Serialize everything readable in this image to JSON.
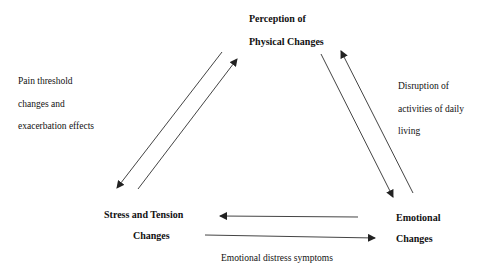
{
  "diagram": {
    "nodes": {
      "top": {
        "lines": [
          "Perception of",
          "Physical Changes"
        ]
      },
      "left": {
        "lines": [
          "Stress and Tension",
          "Changes"
        ]
      },
      "right": {
        "lines": [
          "Emotional",
          "Changes"
        ]
      }
    },
    "edge_labels": {
      "left": {
        "lines": [
          "Pain threshold",
          "changes and",
          "exacerbation effects"
        ]
      },
      "right": {
        "lines": [
          "Disruption of",
          "activities of daily",
          "living"
        ]
      },
      "bottom": {
        "lines": [
          "Emotional distress symptoms"
        ]
      }
    },
    "edges": [
      {
        "from": "Perception of Physical Changes",
        "to": "Stress and Tension Changes"
      },
      {
        "from": "Stress and Tension Changes",
        "to": "Perception of Physical Changes"
      },
      {
        "from": "Perception of Physical Changes",
        "to": "Emotional Changes"
      },
      {
        "from": "Emotional Changes",
        "to": "Perception of Physical Changes"
      },
      {
        "from": "Emotional Changes",
        "to": "Stress and Tension Changes"
      },
      {
        "from": "Stress and Tension Changes",
        "to": "Emotional Changes"
      }
    ],
    "colors": {
      "line": "#333333",
      "text": "#111111",
      "background": "#ffffff"
    }
  }
}
